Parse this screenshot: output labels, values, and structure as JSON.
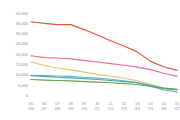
{
  "chart_data": {
    "type": "line",
    "title": "",
    "subtitle": "",
    "xlabel": "",
    "ylabel": "",
    "ylim": [
      0,
      40000
    ],
    "grid": false,
    "legend": "none",
    "categories": [
      "05/06",
      "06/07",
      "07/08",
      "08/09",
      "09/10",
      "10/11",
      "11/12",
      "12/13",
      "13/14",
      "14/15",
      "15/16",
      "16/17"
    ],
    "category_lines": [
      [
        "05",
        "/06"
      ],
      [
        "06",
        "/07"
      ],
      [
        "07",
        "/08"
      ],
      [
        "08",
        "/09"
      ],
      [
        "09",
        "/10"
      ],
      [
        "10",
        "/11"
      ],
      [
        "11",
        "/12"
      ],
      [
        "12",
        "/13"
      ],
      [
        "13",
        "/14"
      ],
      [
        "14",
        "/15"
      ],
      [
        "15",
        "/16"
      ],
      [
        "16",
        "/17"
      ]
    ],
    "ytick_values": [
      0,
      5000,
      10000,
      15000,
      20000,
      25000,
      30000,
      35000,
      40000
    ],
    "ytick_labels": [
      "0",
      "5,000",
      "10,000",
      "15,000",
      "20,000",
      "25,000",
      "30,000",
      "35,000",
      "40,000"
    ],
    "series": [
      {
        "name": "series-1",
        "color": "#e8553c",
        "values": [
          36000,
          35200,
          34600,
          34600,
          32200,
          29600,
          26800,
          24200,
          21400,
          16800,
          14200,
          12400
        ]
      },
      {
        "name": "series-2",
        "color": "#ef6f8e",
        "values": [
          19500,
          18600,
          18400,
          18000,
          17300,
          16500,
          15700,
          14900,
          14000,
          12800,
          11000,
          9500
        ]
      },
      {
        "name": "series-3",
        "color": "#e8c262",
        "values": [
          16500,
          14800,
          13600,
          12700,
          11600,
          10500,
          9600,
          8600,
          7400,
          5600,
          3900,
          3000
        ]
      },
      {
        "name": "series-4",
        "color": "#63b5e0",
        "values": [
          10000,
          9900,
          9700,
          9500,
          9100,
          8700,
          8100,
          7400,
          6500,
          4700,
          2900,
          2000
        ]
      },
      {
        "name": "series-5",
        "color": "#4aa8a0",
        "values": [
          9800,
          9500,
          9100,
          8800,
          8400,
          8000,
          7500,
          7000,
          6400,
          5200,
          3900,
          3200
        ]
      },
      {
        "name": "series-6",
        "color": "#6f9e4c",
        "values": [
          8000,
          7700,
          7500,
          7300,
          7000,
          6700,
          6400,
          6000,
          5600,
          4600,
          3600,
          3100
        ]
      }
    ]
  }
}
